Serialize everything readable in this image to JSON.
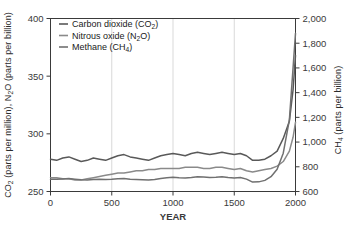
{
  "chart_data": {
    "type": "line",
    "title": "",
    "xlabel": "YEAR",
    "ylabel_left": "CO2 (parts per million), N2O (parts per billion)",
    "ylabel_right": "CH4 (parts per billion)",
    "xlim": [
      0,
      2000
    ],
    "ylim_left": [
      250,
      400
    ],
    "ylim_right": [
      600,
      2000
    ],
    "xticks": [
      0,
      500,
      1000,
      1500,
      2000
    ],
    "xtick_labels": [
      "0",
      "500",
      "1000",
      "1500",
      "2000"
    ],
    "yticks_left": [
      250,
      300,
      350,
      400
    ],
    "ytick_labels_left": [
      "250",
      "300",
      "350",
      "400"
    ],
    "yticks_right": [
      600,
      800,
      1000,
      1200,
      1400,
      1600,
      1800,
      2000
    ],
    "ytick_labels_right": [
      "600",
      "800",
      "1,000",
      "1,200",
      "1,400",
      "1,600",
      "1,800",
      "2,000"
    ],
    "grid": "vertical-only",
    "gridlines_x": [
      500,
      1000,
      1500
    ],
    "legend_position": "top-left-inside",
    "series": [
      {
        "name": "Carbon dioxide (CO2)",
        "legend_label_main": "Carbon dioxide (CO",
        "legend_sub": "2",
        "legend_label_tail": ")",
        "axis": "left",
        "color": "#595959",
        "x": [
          0,
          50,
          100,
          150,
          200,
          250,
          300,
          350,
          400,
          450,
          500,
          550,
          600,
          650,
          700,
          750,
          800,
          850,
          900,
          950,
          1000,
          1050,
          1100,
          1150,
          1200,
          1250,
          1300,
          1350,
          1400,
          1450,
          1500,
          1550,
          1600,
          1650,
          1700,
          1750,
          1800,
          1850,
          1900,
          1950,
          1980,
          2000
        ],
        "y": [
          278,
          277,
          279,
          280,
          278,
          276,
          277,
          279,
          278,
          277,
          279,
          281,
          282,
          280,
          279,
          278,
          277,
          279,
          281,
          282,
          283,
          282,
          281,
          283,
          284,
          283,
          282,
          283,
          284,
          283,
          282,
          283,
          281,
          277,
          277,
          278,
          281,
          285,
          296,
          311,
          338,
          368
        ]
      },
      {
        "name": "Nitrous oxide (N2O)",
        "legend_label_main": "Nitrous oxide (N",
        "legend_sub": "2",
        "legend_label_tail": "O)",
        "axis": "left",
        "color": "#8a8a8a",
        "x": [
          0,
          50,
          100,
          150,
          200,
          250,
          300,
          350,
          400,
          450,
          500,
          550,
          600,
          650,
          700,
          750,
          800,
          850,
          900,
          950,
          1000,
          1050,
          1100,
          1150,
          1200,
          1250,
          1300,
          1350,
          1400,
          1450,
          1500,
          1550,
          1600,
          1650,
          1700,
          1750,
          1800,
          1850,
          1900,
          1950,
          1980,
          2000
        ],
        "y": [
          262,
          262,
          261,
          261,
          260,
          260,
          261,
          262,
          263,
          264,
          265,
          266,
          266,
          267,
          268,
          268,
          269,
          269,
          270,
          270,
          270,
          270,
          271,
          271,
          271,
          270,
          270,
          271,
          271,
          270,
          269,
          270,
          268,
          267,
          268,
          269,
          270,
          272,
          276,
          285,
          297,
          310
        ]
      },
      {
        "name": "Methane (CH4)",
        "legend_label_main": "Methane (CH",
        "legend_sub": "4",
        "legend_label_tail": ")",
        "axis": "right",
        "color": "#707070",
        "x": [
          0,
          50,
          100,
          150,
          200,
          250,
          300,
          350,
          400,
          450,
          500,
          550,
          600,
          650,
          700,
          750,
          800,
          850,
          900,
          950,
          1000,
          1050,
          1100,
          1150,
          1200,
          1250,
          1300,
          1350,
          1400,
          1450,
          1500,
          1550,
          1600,
          1650,
          1700,
          1750,
          1800,
          1850,
          1900,
          1950,
          1980,
          2000
        ],
        "y": [
          700,
          700,
          702,
          705,
          700,
          696,
          694,
          698,
          700,
          698,
          700,
          704,
          706,
          700,
          698,
          696,
          694,
          698,
          706,
          712,
          716,
          712,
          710,
          714,
          720,
          718,
          714,
          716,
          720,
          714,
          710,
          714,
          700,
          676,
          678,
          690,
          720,
          780,
          910,
          1180,
          1600,
          1880
        ]
      }
    ]
  },
  "legend": {
    "items": [
      {
        "label": "Carbon dioxide (CO2)"
      },
      {
        "label": "Nitrous oxide (N2O)"
      },
      {
        "label": "Methane (CH4)"
      }
    ]
  }
}
